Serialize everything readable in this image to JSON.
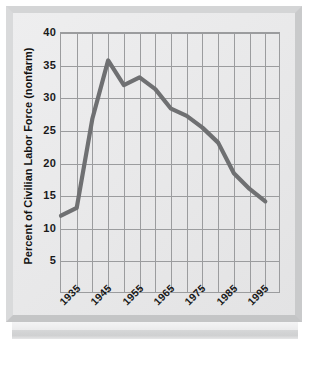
{
  "figure": {
    "frame_color": "#d4d5d6",
    "plot_background": "#e9e9ea",
    "gridline_color": "#9b9c9e",
    "line_color": "#6f7072"
  },
  "chart_data": {
    "type": "line",
    "title": "",
    "xlabel": "",
    "ylabel": "Percent of Civilian Labor Force (nonfarm)",
    "xlim": [
      1930,
      2000
    ],
    "ylim": [
      0,
      40
    ],
    "grid": true,
    "legend": false,
    "ytick_labels": [
      "5",
      "10",
      "15",
      "20",
      "25",
      "30",
      "35",
      "40"
    ],
    "ytick_values": [
      5,
      10,
      15,
      20,
      25,
      30,
      35,
      40
    ],
    "xtick_labels": [
      "1935",
      "1945",
      "1955",
      "1965",
      "1975",
      "1985",
      "1995"
    ],
    "xtick_values": [
      1935,
      1945,
      1955,
      1965,
      1975,
      1985,
      1995
    ],
    "x": [
      1930,
      1935,
      1940,
      1945,
      1950,
      1955,
      1960,
      1965,
      1970,
      1975,
      1980,
      1985,
      1990,
      1995
    ],
    "values": [
      12.0,
      13.2,
      26.9,
      35.8,
      32.0,
      33.2,
      31.4,
      28.4,
      27.3,
      25.5,
      23.2,
      18.5,
      16.1,
      14.2
    ],
    "series": [
      {
        "name": "Union membership",
        "color": "#6f7072",
        "values": [
          12.0,
          13.2,
          26.9,
          35.8,
          32.0,
          33.2,
          31.4,
          28.4,
          27.3,
          25.5,
          23.2,
          18.5,
          16.1,
          14.2
        ]
      }
    ]
  }
}
